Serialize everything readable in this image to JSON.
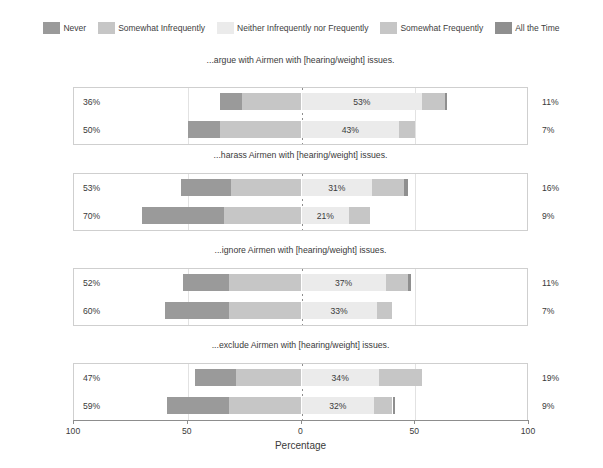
{
  "legend": {
    "items": [
      {
        "label": "Never",
        "color": "#9a9a9a",
        "icon": "legend-swatch-never"
      },
      {
        "label": "Somewhat Infrequently",
        "color": "#c6c6c6",
        "icon": "legend-swatch-somewhat-infrequently"
      },
      {
        "label": "Neither Infrequently nor Frequently",
        "color": "#ebebeb",
        "icon": "legend-swatch-neither"
      },
      {
        "label": "Somewhat Frequently",
        "color": "#c6c6c6",
        "icon": "legend-swatch-somewhat-frequently"
      },
      {
        "label": "All the Time",
        "color": "#8f8f8f",
        "icon": "legend-swatch-all-the-time"
      }
    ]
  },
  "axis": {
    "title": "Percentage",
    "ticks": [
      {
        "label": "100",
        "value": -100
      },
      {
        "label": "50",
        "value": -50
      },
      {
        "label": "0",
        "value": 0
      },
      {
        "label": "50",
        "value": 50
      },
      {
        "label": "100",
        "value": 100
      }
    ],
    "range": [
      -100,
      100
    ]
  },
  "chart_data": {
    "type": "bar",
    "subtype": "diverging-stacked-likert",
    "title": "",
    "xlabel": "Percentage",
    "ylabel": "",
    "xlim": [
      -100,
      100
    ],
    "grid": true,
    "legend_position": "top",
    "categories": [
      "Never",
      "Somewhat Infrequently",
      "Neither Infrequently nor Frequently",
      "Somewhat Frequently",
      "All the Time"
    ],
    "rows": [
      "Weight",
      "Hearing"
    ],
    "panels": [
      {
        "title": "...argue with Airmen with [hearing/weight] issues.",
        "rows": [
          {
            "name": "Weight",
            "values": {
              "never": 10,
              "somewhat_infrequently": 26,
              "neither": 53,
              "somewhat_frequently": 10,
              "all_the_time": 1
            },
            "label_left": "36%",
            "label_mid": "53%",
            "label_right": "11%"
          },
          {
            "name": "Hearing",
            "values": {
              "never": 14,
              "somewhat_infrequently": 36,
              "neither": 43,
              "somewhat_frequently": 7,
              "all_the_time": 0
            },
            "label_left": "50%",
            "label_mid": "43%",
            "label_right": "7%"
          }
        ]
      },
      {
        "title": "...harass Airmen with [hearing/weight] issues.",
        "rows": [
          {
            "name": "Weight",
            "values": {
              "never": 22,
              "somewhat_infrequently": 31,
              "neither": 31,
              "somewhat_frequently": 14,
              "all_the_time": 2
            },
            "label_left": "53%",
            "label_mid": "31%",
            "label_right": "16%"
          },
          {
            "name": "Hearing",
            "values": {
              "never": 36,
              "somewhat_infrequently": 34,
              "neither": 21,
              "somewhat_frequently": 9,
              "all_the_time": 0
            },
            "label_left": "70%",
            "label_mid": "21%",
            "label_right": "9%"
          }
        ]
      },
      {
        "title": "...ignore Airmen with [hearing/weight] issues.",
        "rows": [
          {
            "name": "Weight",
            "values": {
              "never": 20,
              "somewhat_infrequently": 32,
              "neither": 37,
              "somewhat_frequently": 10,
              "all_the_time": 1
            },
            "label_left": "52%",
            "label_mid": "37%",
            "label_right": "11%"
          },
          {
            "name": "Hearing",
            "values": {
              "never": 28,
              "somewhat_infrequently": 32,
              "neither": 33,
              "somewhat_frequently": 7,
              "all_the_time": 0
            },
            "label_left": "60%",
            "label_mid": "33%",
            "label_right": "7%"
          }
        ]
      },
      {
        "title": "...exclude Airmen with [hearing/weight] issues.",
        "rows": [
          {
            "name": "Weight",
            "values": {
              "never": 18,
              "somewhat_infrequently": 29,
              "neither": 34,
              "somewhat_frequently": 19,
              "all_the_time": 0
            },
            "label_left": "47%",
            "label_mid": "34%",
            "label_right": "19%"
          },
          {
            "name": "Hearing",
            "values": {
              "never": 27,
              "somewhat_infrequently": 32,
              "neither": 32,
              "somewhat_frequently": 8,
              "all_the_time": 1
            },
            "label_left": "59%",
            "label_mid": "32%",
            "label_right": "9%"
          }
        ]
      }
    ]
  }
}
